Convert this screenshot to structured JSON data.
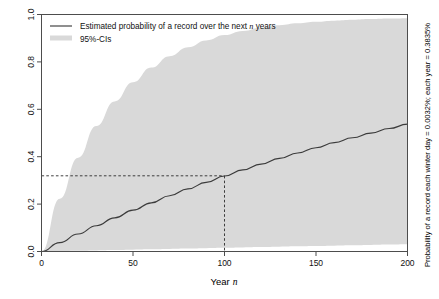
{
  "chart_data": {
    "type": "line",
    "title": "",
    "xlabel": "Year n",
    "xlabel_plain": "Year",
    "xlabel_italic": "n",
    "ylabel": "",
    "right_axis_label": "Probability of a record each winter day = 0.0032%; each year = 0.3835%",
    "xlim": [
      0,
      200
    ],
    "ylim": [
      0.0,
      1.0
    ],
    "xticks": [
      0,
      50,
      100,
      150,
      200
    ],
    "xtick_labels": [
      "0",
      "50",
      "100",
      "150",
      "200"
    ],
    "yticks": [
      0.0,
      0.2,
      0.4,
      0.6,
      0.8,
      1.0
    ],
    "ytick_labels": [
      "0.0",
      "0.2",
      "0.4",
      "0.6",
      "0.8",
      "1.0"
    ],
    "grid": false,
    "legend_position": "top-left",
    "legend": [
      {
        "label_plain_before": "Estimated probability of a record over the next ",
        "label_italic": "n",
        "label_plain_after": " years",
        "type": "line",
        "color": "#3c3c3c"
      },
      {
        "label_plain_before": "95%-CIs",
        "label_italic": "",
        "label_plain_after": "",
        "type": "band",
        "color": "#d9d9d9"
      }
    ],
    "annotations": {
      "reference_x": 100,
      "reference_y": 0.3194,
      "reference_style": "dashed",
      "reference_color": "#2b2b2b"
    },
    "x": [
      0,
      10,
      20,
      30,
      40,
      50,
      60,
      70,
      80,
      90,
      100,
      110,
      120,
      130,
      140,
      150,
      160,
      170,
      180,
      190,
      200
    ],
    "series": [
      {
        "name": "Estimated probability of a record over the next n years",
        "color": "#3c3c3c",
        "values": [
          0.0,
          0.0376,
          0.0738,
          0.1086,
          0.1421,
          0.1744,
          0.2054,
          0.2353,
          0.2641,
          0.2918,
          0.3185,
          0.3442,
          0.3689,
          0.3928,
          0.4158,
          0.4379,
          0.4593,
          0.4798,
          0.4997,
          0.5188,
          0.5372
        ]
      },
      {
        "name": "95%-CI upper",
        "color": "#d9d9d9",
        "values": [
          0.0,
          0.2231,
          0.3958,
          0.5296,
          0.6333,
          0.7137,
          0.776,
          0.8243,
          0.8617,
          0.8907,
          0.9132,
          0.9306,
          0.9441,
          0.9546,
          0.9627,
          0.969,
          0.9739,
          0.9776,
          0.9806,
          0.9828,
          0.9846
        ]
      },
      {
        "name": "95%-CI lower",
        "color": "#d9d9d9",
        "values": [
          0.0,
          0.0016,
          0.0032,
          0.0047,
          0.0063,
          0.0079,
          0.0094,
          0.011,
          0.0125,
          0.0141,
          0.0156,
          0.0171,
          0.0187,
          0.0202,
          0.0217,
          0.0232,
          0.0247,
          0.0262,
          0.0277,
          0.0292,
          0.0307
        ]
      }
    ]
  },
  "colors": {
    "line": "#3c3c3c",
    "band": "#d9d9d9",
    "frame": "#4d4d4d",
    "background": "#ffffff",
    "dashed": "#2b2b2b"
  }
}
